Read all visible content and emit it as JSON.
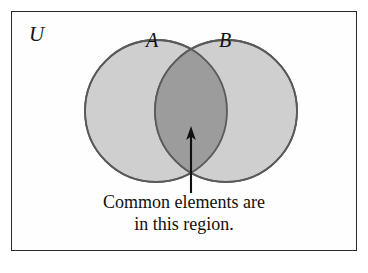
{
  "figure": {
    "type": "venn-diagram-two-set",
    "universe_label": "U",
    "set_a_label": "A",
    "set_b_label": "B",
    "caption_line_1": "Common elements are",
    "caption_line_2": "in this region.",
    "annotation_target": "intersection",
    "colors": {
      "frame_border": "#2b2b2b",
      "page_background": "#ffffff",
      "frame_background": "#fefefe",
      "circle_fill": "#cfcfcf",
      "intersection_fill": "#9c9c9c",
      "circle_stroke": "#5a5a5a",
      "text": "#101010",
      "arrow": "#111111"
    },
    "geometry": {
      "frame": {
        "x": 11,
        "y": 11,
        "width": 346,
        "height": 240
      },
      "circle_a": {
        "cx": 156,
        "cy": 111,
        "r": 71
      },
      "circle_b": {
        "cx": 226,
        "cy": 111,
        "r": 71
      },
      "arrow": {
        "x": 191,
        "tip_y": 127,
        "tail_y": 193
      }
    }
  }
}
